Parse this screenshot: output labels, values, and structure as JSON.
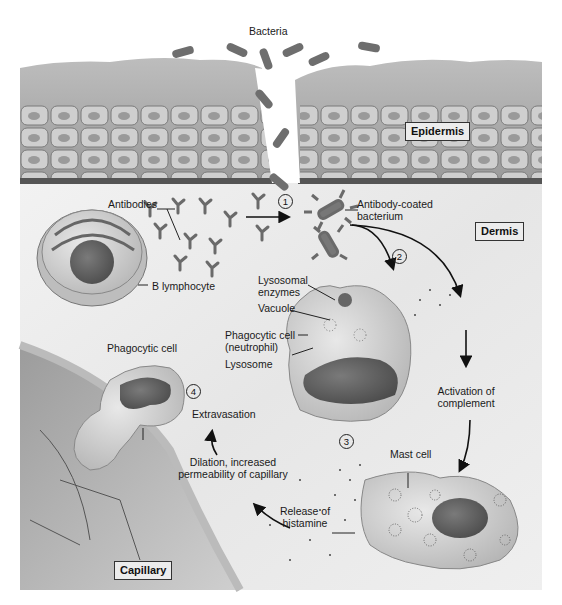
{
  "regions": {
    "epidermis": "Epidermis",
    "dermis": "Dermis",
    "capillary": "Capillary"
  },
  "labels": {
    "bacteria": "Bacteria",
    "antibodies": "Antibodies",
    "antibody_coated_1": "Antibody-coated",
    "antibody_coated_2": "bacterium",
    "b_lymphocyte": "B lymphocyte",
    "lysosomal_1": "Lysosomal",
    "lysosomal_2": "enzymes",
    "vacuole": "Vacuole",
    "phagocytic_neutrophil_1": "Phagocytic cell",
    "phagocytic_neutrophil_2": "(neutrophil)",
    "lysosome": "Lysosome",
    "phagocytic_cell": "Phagocytic cell",
    "extravasation": "Extravasation",
    "activation_1": "Activation of",
    "activation_2": "complement",
    "mast_cell": "Mast cell",
    "dilation_1": "Dilation, increased",
    "dilation_2": "permeability of capillary",
    "release_1": "Release of",
    "release_2": "histamine"
  },
  "steps": [
    "1",
    "2",
    "3",
    "4"
  ],
  "colors": {
    "tissue_gray": "#8a8a8a",
    "dermis_bg": "#ededed",
    "cell_fill": "#d9d9d9",
    "nucleus": "#5a5a5a",
    "bacteria": "#6e6e6e",
    "line": "#1a1a1a"
  }
}
